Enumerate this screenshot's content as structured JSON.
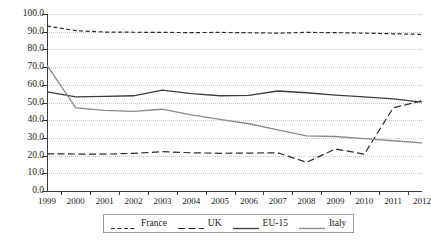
{
  "chart_data": {
    "type": "line",
    "title": "",
    "subtitle": "",
    "xlabel": "",
    "ylabel": "",
    "x": [
      1999,
      2000,
      2001,
      2002,
      2003,
      2004,
      2005,
      2006,
      2007,
      2008,
      2009,
      2010,
      2011,
      2012
    ],
    "categories": [
      "1999",
      "2000",
      "2001",
      "2002",
      "2003",
      "2004",
      "2005",
      "2006",
      "2007",
      "2008",
      "2009",
      "2010",
      "2011",
      "2012"
    ],
    "xlim": [
      1999,
      2012
    ],
    "ylim": [
      0.0,
      100.0
    ],
    "yticks": [
      "0.0",
      "10.0",
      "20.0",
      "30.0",
      "40.0",
      "50.0",
      "60.0",
      "70.0",
      "80.0",
      "90.0",
      "100.0"
    ],
    "ytick_values": [
      0,
      10,
      20,
      30,
      40,
      50,
      60,
      70,
      80,
      90,
      100
    ],
    "grid": "horizontal-dotted",
    "legend_position": "bottom-center",
    "series": [
      {
        "name": "France",
        "style": "short-dash",
        "color": "#2b2b2b",
        "values": [
          93.2,
          90.6,
          89.8,
          89.7,
          89.6,
          89.5,
          89.6,
          89.4,
          89.2,
          89.6,
          89.5,
          89.2,
          88.8,
          88.5
        ]
      },
      {
        "name": "UK",
        "style": "long-dash",
        "color": "#2b2b2b",
        "values": [
          21.0,
          20.9,
          20.8,
          21.3,
          22.2,
          21.6,
          21.3,
          21.4,
          21.6,
          16.2,
          23.8,
          20.8,
          47.0,
          51.0
        ]
      },
      {
        "name": "EU-15",
        "style": "solid",
        "color": "#3d3d3d",
        "values": [
          56.0,
          53.2,
          53.5,
          53.8,
          57.0,
          55.0,
          53.8,
          54.0,
          56.5,
          55.5,
          54.2,
          53.2,
          52.0,
          50.2
        ]
      },
      {
        "name": "Italy",
        "style": "solid",
        "color": "#8a8a8a",
        "values": [
          71.0,
          47.0,
          45.5,
          45.0,
          46.2,
          43.0,
          40.5,
          38.0,
          34.5,
          31.2,
          30.8,
          29.6,
          28.4,
          27.2
        ]
      }
    ]
  },
  "legend": {
    "items": [
      {
        "label": "France"
      },
      {
        "label": "UK"
      },
      {
        "label": "EU-15"
      },
      {
        "label": "Italy"
      }
    ]
  }
}
